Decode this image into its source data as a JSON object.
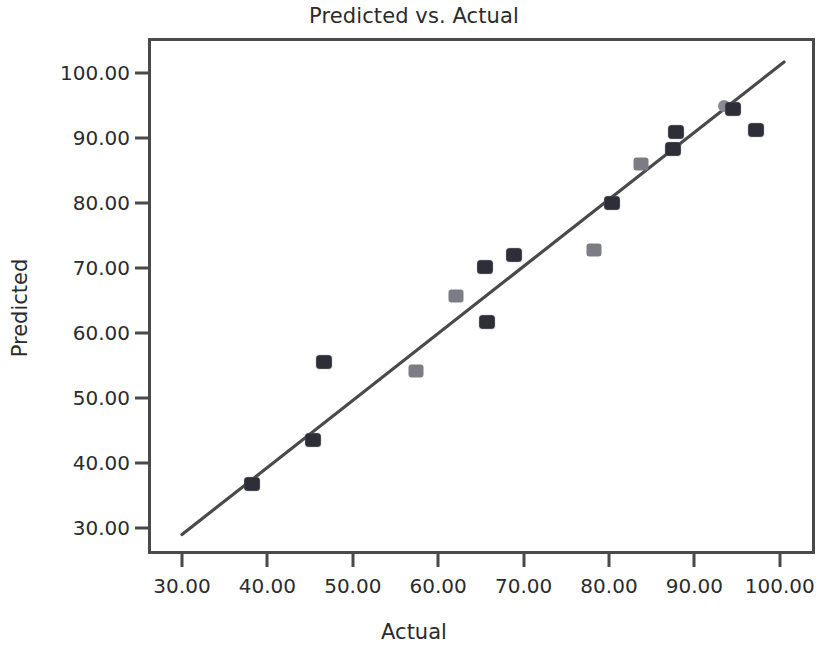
{
  "chart_data": {
    "type": "scatter",
    "title": "Predicted vs. Actual",
    "xlabel": "Actual",
    "ylabel": "Predicted",
    "xlim": [
      26,
      102
    ],
    "ylim": [
      26,
      102
    ],
    "grid": false,
    "legend": null,
    "x_ticks": [
      "30.00",
      "40.00",
      "50.00",
      "60.00",
      "70.00",
      "80.00",
      "90.00",
      "100.00"
    ],
    "x_tick_values": [
      30,
      40,
      50,
      60,
      70,
      80,
      90,
      100
    ],
    "y_ticks": [
      "30.00",
      "40.00",
      "50.00",
      "60.00",
      "70.00",
      "80.00",
      "90.00",
      "100.00"
    ],
    "y_tick_values": [
      30,
      40,
      50,
      60,
      70,
      80,
      90,
      100
    ],
    "series": [
      {
        "name": "Predicted vs. Actual",
        "marker": "square",
        "color": "#2e2e38",
        "points": [
          {
            "x": 38.2,
            "y": 36.8,
            "style": "square"
          },
          {
            "x": 45.3,
            "y": 43.5,
            "style": "square"
          },
          {
            "x": 46.6,
            "y": 55.5,
            "style": "square"
          },
          {
            "x": 57.4,
            "y": 54.2,
            "style": "faint"
          },
          {
            "x": 62.1,
            "y": 65.7,
            "style": "faint"
          },
          {
            "x": 65.5,
            "y": 70.1,
            "style": "square"
          },
          {
            "x": 65.7,
            "y": 61.7,
            "style": "square"
          },
          {
            "x": 68.9,
            "y": 72.0,
            "style": "square"
          },
          {
            "x": 78.3,
            "y": 72.7,
            "style": "faint"
          },
          {
            "x": 80.4,
            "y": 80.0,
            "style": "square"
          },
          {
            "x": 83.8,
            "y": 86.0,
            "style": "faint"
          },
          {
            "x": 87.5,
            "y": 88.3,
            "style": "square"
          },
          {
            "x": 87.8,
            "y": 91.0,
            "style": "square"
          },
          {
            "x": 93.5,
            "y": 95.0,
            "style": "circle"
          },
          {
            "x": 94.5,
            "y": 94.5,
            "style": "square"
          },
          {
            "x": 97.2,
            "y": 91.2,
            "style": "square"
          }
        ]
      }
    ],
    "fit_line": {
      "type": "linear",
      "x_start": 30.0,
      "y_start": 29.0,
      "x_end": 100.5,
      "y_end": 101.7,
      "color": "#4a4a4a"
    }
  }
}
